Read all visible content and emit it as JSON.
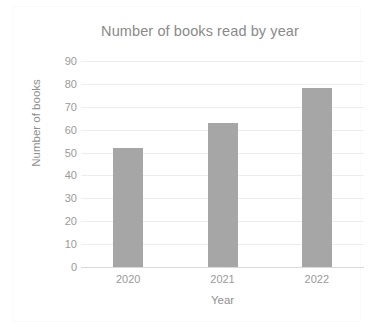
{
  "chart_data": {
    "type": "bar",
    "title": "Number of books read by year",
    "xlabel": "Year",
    "ylabel": "Number of books",
    "categories": [
      "2020",
      "2021",
      "2022"
    ],
    "values": [
      52,
      63,
      78
    ],
    "series": [
      {
        "name": "Number of books",
        "values": [
          52,
          63,
          78
        ]
      }
    ],
    "ylim": [
      0,
      90
    ],
    "y_ticks": [
      0,
      10,
      20,
      30,
      40,
      50,
      60,
      70,
      80,
      90
    ],
    "y_tick_labels": [
      "0",
      "10",
      "20",
      "30",
      "40",
      "50",
      "60",
      "70",
      "80",
      "90"
    ],
    "grid": true,
    "legend": false,
    "legend_position": "none",
    "colors": {
      "bar": "#a6a6a6",
      "gridline": "#ededed",
      "baseline": "#d9d9d9",
      "title_text": "#8a8a8a",
      "tick_text": "#9a9a9a",
      "axis_title_text": "#8f8f8f",
      "plot_background": "#ffffff",
      "frame_border": "#fbfbfb"
    }
  }
}
